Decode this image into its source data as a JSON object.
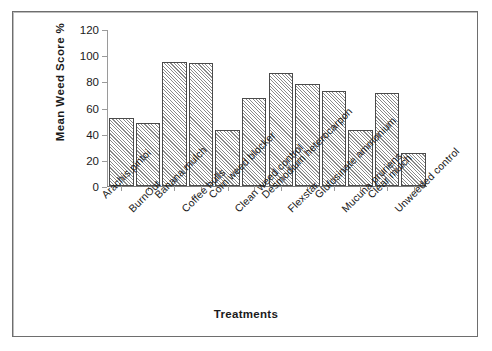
{
  "chart_data": {
    "type": "bar",
    "title": "",
    "xlabel": "Treatments",
    "ylabel": "Mean Weed Score %",
    "ylim": [
      0,
      120
    ],
    "ytick_step": 20,
    "yticks": [
      0,
      20,
      40,
      60,
      80,
      100,
      120
    ],
    "grid": false,
    "legend": "none",
    "categories": [
      "Arachis pintoi",
      "BurnOut",
      "Banana mulch",
      "Coffee hulls",
      "Corn weed blocker",
      "Clean weed control",
      "Desmodium heterocarpon",
      "Flexstar",
      "Glufosinate ammonium",
      "Mucuna pruriens",
      "Clear mulch",
      "Unweeded control"
    ],
    "values": [
      52,
      48,
      95,
      94,
      43,
      67,
      86,
      78,
      73,
      43,
      71,
      25
    ],
    "bar_fill": "#d9d9d9",
    "bar_hatch": "diagonal",
    "bar_edge": "#4a4a4a"
  }
}
